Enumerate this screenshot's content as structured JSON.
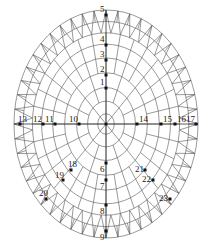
{
  "figure": {
    "type": "dome-grid-plan",
    "line_color": "#555555",
    "node_color": "#111111",
    "center": {
      "x": 106,
      "y": 124
    },
    "outer_radius": {
      "rx": 92,
      "ry": 114
    },
    "ring_count": 8,
    "radial_count": 32
  },
  "nodes": [
    {
      "id": "1",
      "x": 106,
      "y": 88,
      "label_dx": -6,
      "label_dy": -3
    },
    {
      "id": "2",
      "x": 106,
      "y": 75,
      "label_dx": -6,
      "label_dy": -3
    },
    {
      "id": "3",
      "x": 106,
      "y": 60,
      "label_dx": -6,
      "label_dy": -3
    },
    {
      "id": "4",
      "x": 106,
      "y": 45,
      "label_dx": -6,
      "label_dy": -3
    },
    {
      "id": "5",
      "x": 106,
      "y": 15,
      "label_dx": -6,
      "label_dy": -3
    },
    {
      "id": "6",
      "x": 106,
      "y": 163,
      "label_dx": -6,
      "label_dy": 9
    },
    {
      "id": "7",
      "x": 106,
      "y": 180,
      "label_dx": -6,
      "label_dy": 9
    },
    {
      "id": "8",
      "x": 106,
      "y": 205,
      "label_dx": -6,
      "label_dy": 9
    },
    {
      "id": "9",
      "x": 106,
      "y": 231,
      "label_dx": -6,
      "label_dy": 9
    },
    {
      "id": "10",
      "x": 79,
      "y": 124,
      "label_dx": -10,
      "label_dy": -2
    },
    {
      "id": "11",
      "x": 55,
      "y": 124,
      "label_dx": -10,
      "label_dy": -2
    },
    {
      "id": "12",
      "x": 43,
      "y": 124,
      "label_dx": -10,
      "label_dy": -2
    },
    {
      "id": "13",
      "x": 20,
      "y": 124,
      "label_dx": -2,
      "label_dy": -2
    },
    {
      "id": "14",
      "x": 137,
      "y": 124,
      "label_dx": 2,
      "label_dy": -2
    },
    {
      "id": "15",
      "x": 161,
      "y": 124,
      "label_dx": 2,
      "label_dy": -2
    },
    {
      "id": "16",
      "x": 175,
      "y": 124,
      "label_dx": 2,
      "label_dy": -2
    },
    {
      "id": "17",
      "x": 196,
      "y": 124,
      "label_dx": -10,
      "label_dy": -2
    },
    {
      "id": "18",
      "x": 71,
      "y": 170,
      "label_dx": -3,
      "label_dy": -3
    },
    {
      "id": "19",
      "x": 63,
      "y": 180,
      "label_dx": -8,
      "label_dy": -2
    },
    {
      "id": "20",
      "x": 46,
      "y": 199,
      "label_dx": -7,
      "label_dy": -3
    },
    {
      "id": "21",
      "x": 145,
      "y": 170,
      "label_dx": -10,
      "label_dy": 2
    },
    {
      "id": "22",
      "x": 153,
      "y": 180,
      "label_dx": -11,
      "label_dy": 2
    },
    {
      "id": "23",
      "x": 170,
      "y": 199,
      "label_dx": -11,
      "label_dy": 2
    }
  ]
}
